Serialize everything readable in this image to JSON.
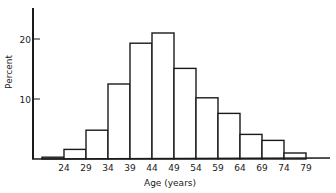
{
  "chart_data": {
    "type": "bar",
    "subtype": "histogram",
    "title": "",
    "xlabel": "Age (years)",
    "ylabel": "Percent",
    "categories": [
      "19-24",
      "24-29",
      "29-34",
      "34-39",
      "39-44",
      "44-49",
      "49-54",
      "54-59",
      "59-64",
      "64-69",
      "69-74",
      "74-79"
    ],
    "bin_edges": [
      19,
      24,
      29,
      34,
      39,
      44,
      49,
      54,
      59,
      64,
      69,
      74,
      79
    ],
    "values": [
      0.3,
      1.6,
      4.8,
      12.5,
      19.3,
      21.0,
      15.1,
      10.2,
      7.6,
      4.1,
      3.1,
      1.0
    ],
    "x_tick_labels": [
      "24",
      "29",
      "34",
      "39",
      "44",
      "49",
      "54",
      "59",
      "64",
      "69",
      "74",
      "79"
    ],
    "y_ticks": [
      10,
      20
    ],
    "y_tick_labels": [
      "10",
      "20"
    ],
    "ylim": [
      0,
      25
    ],
    "grid": false,
    "legend": null
  },
  "colors": {
    "ink": "#1a1a1a",
    "bar_fill": "#ffffff",
    "background": "#ffffff"
  }
}
